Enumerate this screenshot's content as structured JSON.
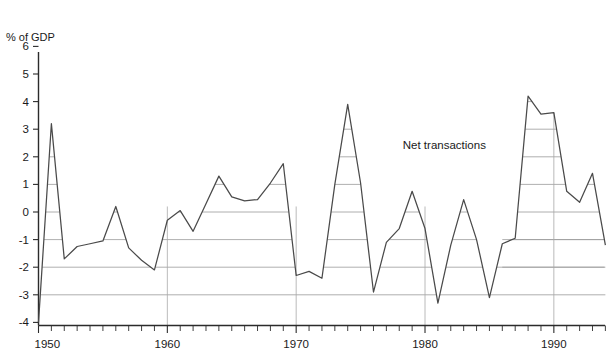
{
  "chart_data": {
    "type": "line",
    "title": "",
    "subtitle": "",
    "ylabel": "% of GDP",
    "xlabel": "",
    "ylim": [
      -4,
      6
    ],
    "xlim": [
      1950,
      1994
    ],
    "grid": "horizontal-under-curve",
    "legend_position": "inline-annotation",
    "y_ticks": [
      6,
      5,
      4,
      3,
      2,
      1,
      0,
      -1,
      -2,
      -3,
      -4
    ],
    "y_tick_labels": [
      "6",
      "5",
      "4",
      "3",
      "2",
      "1",
      "0",
      "-1",
      "-2",
      "-3",
      "-4"
    ],
    "x_ticks": [
      1950,
      1960,
      1970,
      1980,
      1990
    ],
    "x_tick_labels": [
      "1950",
      "1960",
      "1970",
      "1980",
      "1990"
    ],
    "x_minor_tick_step": 1,
    "annotations": [
      {
        "text": "Net transactions",
        "x": 1981.5,
        "y": 2.3
      }
    ],
    "series": [
      {
        "name": "Net transactions",
        "color": "#4a4a4a",
        "x": [
          1950,
          1951,
          1952,
          1953,
          1954,
          1955,
          1956,
          1957,
          1958,
          1959,
          1960,
          1961,
          1962,
          1963,
          1964,
          1965,
          1966,
          1967,
          1968,
          1969,
          1970,
          1971,
          1972,
          1973,
          1974,
          1975,
          1976,
          1977,
          1978,
          1979,
          1980,
          1981,
          1982,
          1983,
          1984,
          1985,
          1986,
          1987,
          1988,
          1989,
          1990,
          1991,
          1992,
          1993,
          1994
        ],
        "values": [
          -4.0,
          3.2,
          -1.7,
          -1.25,
          -1.15,
          -1.05,
          0.2,
          -1.3,
          -1.75,
          -2.1,
          -0.3,
          0.05,
          -0.7,
          0.3,
          1.3,
          0.55,
          0.4,
          0.45,
          1.05,
          1.75,
          -2.3,
          -2.15,
          -2.4,
          1.0,
          3.9,
          1.05,
          -2.9,
          -1.1,
          -0.6,
          0.75,
          -0.6,
          -3.3,
          -1.2,
          0.45,
          -1.0,
          -3.1,
          -1.15,
          -0.95,
          4.2,
          3.55,
          3.6,
          0.75,
          0.35,
          1.4,
          -1.2
        ]
      }
    ]
  },
  "axis": {
    "y_axis_label": "% of GDP"
  }
}
